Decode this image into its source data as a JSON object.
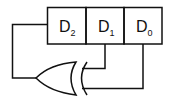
{
  "diagram": {
    "type": "linear-feedback-shift-register",
    "registers": [
      {
        "letter": "D",
        "sub": "2"
      },
      {
        "letter": "D",
        "sub": "1"
      },
      {
        "letter": "D",
        "sub": "0"
      }
    ],
    "gate": "XOR",
    "connections": [
      {
        "from": "D1",
        "to": "XOR input 1"
      },
      {
        "from": "D0",
        "to": "XOR input 2"
      },
      {
        "from": "XOR output",
        "to": "D2"
      }
    ],
    "colors": {
      "stroke": "#111111",
      "background": "#ffffff"
    }
  }
}
